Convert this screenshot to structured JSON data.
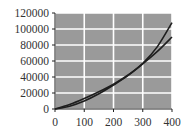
{
  "chart_data": {
    "type": "line",
    "title": "",
    "xlabel": "",
    "ylabel": "",
    "xlim": [
      0,
      400
    ],
    "ylim": [
      0,
      120000
    ],
    "grid": true,
    "legend": null,
    "x_ticks": [
      "0",
      "100",
      "200",
      "300",
      "400"
    ],
    "y_ticks": [
      "0",
      "20000",
      "40000",
      "60000",
      "80000",
      "100000",
      "120000"
    ],
    "x": [
      0,
      50,
      100,
      150,
      200,
      250,
      300,
      350,
      400
    ],
    "series": [
      {
        "name": "curve-1",
        "values": [
          0,
          3500,
          10000,
          19000,
          30000,
          42000,
          57000,
          78000,
          108000
        ]
      },
      {
        "name": "curve-2",
        "values": [
          0,
          5500,
          13000,
          21500,
          31000,
          42500,
          56500,
          72000,
          90000
        ]
      }
    ],
    "colors": {
      "plot_bg": "#9a9a9a",
      "grid": "#ffffff",
      "line": "#1e1e1e"
    }
  }
}
